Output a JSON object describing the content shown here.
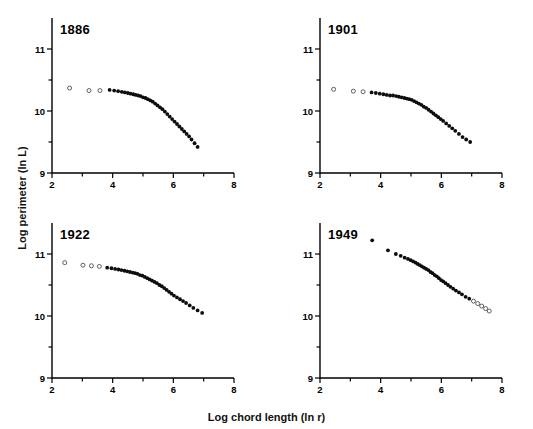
{
  "figure": {
    "xlabel": "Log chord length (ln r)",
    "ylabel": "Log perimeter (ln L)"
  },
  "chart_data": [
    {
      "type": "scatter",
      "title": "1886",
      "xlabel": "Log chord length (ln r)",
      "ylabel": "Log perimeter (ln L)",
      "xlim": [
        2,
        8
      ],
      "ylim": [
        9,
        11.5
      ],
      "xticks": [
        2,
        3,
        4,
        5,
        6,
        7,
        8
      ],
      "xticklabels": [
        "2",
        "",
        "4",
        "",
        "6",
        "",
        "8"
      ],
      "yticks": [
        9,
        9.5,
        10,
        10.5,
        11
      ],
      "yticklabels": [
        "9",
        "",
        "10",
        "",
        "11"
      ],
      "grid": false,
      "legend": null,
      "series": [
        {
          "name": "excluded (open circles)",
          "marker": "open",
          "points": [
            [
              2.58,
              10.37
            ],
            [
              3.22,
              10.33
            ],
            [
              3.58,
              10.33
            ]
          ]
        },
        {
          "name": "included (filled circles)",
          "marker": "filled",
          "points": [
            [
              3.9,
              10.34
            ],
            [
              4.05,
              10.33
            ],
            [
              4.18,
              10.32
            ],
            [
              4.3,
              10.31
            ],
            [
              4.4,
              10.3
            ],
            [
              4.5,
              10.29
            ],
            [
              4.59,
              10.28
            ],
            [
              4.68,
              10.27
            ],
            [
              4.76,
              10.26
            ],
            [
              4.84,
              10.25
            ],
            [
              4.92,
              10.24
            ],
            [
              5.0,
              10.22
            ],
            [
              5.08,
              10.21
            ],
            [
              5.16,
              10.19
            ],
            [
              5.24,
              10.17
            ],
            [
              5.32,
              10.15
            ],
            [
              5.4,
              10.12
            ],
            [
              5.48,
              10.09
            ],
            [
              5.56,
              10.06
            ],
            [
              5.64,
              10.03
            ],
            [
              5.72,
              9.99
            ],
            [
              5.8,
              9.95
            ],
            [
              5.88,
              9.91
            ],
            [
              5.96,
              9.87
            ],
            [
              6.04,
              9.83
            ],
            [
              6.12,
              9.79
            ],
            [
              6.2,
              9.75
            ],
            [
              6.28,
              9.71
            ],
            [
              6.36,
              9.67
            ],
            [
              6.44,
              9.63
            ],
            [
              6.52,
              9.59
            ],
            [
              6.6,
              9.54
            ],
            [
              6.7,
              9.48
            ],
            [
              6.8,
              9.42
            ]
          ]
        }
      ]
    },
    {
      "type": "scatter",
      "title": "1901",
      "xlabel": "Log chord length (ln r)",
      "ylabel": "Log perimeter (ln L)",
      "xlim": [
        2,
        8
      ],
      "ylim": [
        9,
        11.5
      ],
      "xticks": [
        2,
        3,
        4,
        5,
        6,
        7,
        8
      ],
      "xticklabels": [
        "2",
        "",
        "4",
        "",
        "6",
        "",
        "8"
      ],
      "yticks": [
        9,
        9.5,
        10,
        10.5,
        11
      ],
      "yticklabels": [
        "9",
        "",
        "10",
        "",
        "11"
      ],
      "grid": false,
      "legend": null,
      "series": [
        {
          "name": "excluded (open circles)",
          "marker": "open",
          "points": [
            [
              2.45,
              10.35
            ],
            [
              3.1,
              10.32
            ],
            [
              3.42,
              10.31
            ]
          ]
        },
        {
          "name": "included (filled circles)",
          "marker": "filled",
          "points": [
            [
              3.7,
              10.3
            ],
            [
              3.84,
              10.29
            ],
            [
              3.97,
              10.28
            ],
            [
              4.09,
              10.27
            ],
            [
              4.2,
              10.26
            ],
            [
              4.31,
              10.25
            ],
            [
              4.41,
              10.25
            ],
            [
              4.51,
              10.24
            ],
            [
              4.6,
              10.23
            ],
            [
              4.69,
              10.22
            ],
            [
              4.78,
              10.21
            ],
            [
              4.86,
              10.2
            ],
            [
              4.94,
              10.19
            ],
            [
              5.02,
              10.18
            ],
            [
              5.1,
              10.16
            ],
            [
              5.18,
              10.14
            ],
            [
              5.26,
              10.12
            ],
            [
              5.34,
              10.1
            ],
            [
              5.42,
              10.07
            ],
            [
              5.5,
              10.05
            ],
            [
              5.58,
              10.02
            ],
            [
              5.66,
              9.99
            ],
            [
              5.74,
              9.96
            ],
            [
              5.82,
              9.93
            ],
            [
              5.9,
              9.9
            ],
            [
              5.98,
              9.87
            ],
            [
              6.06,
              9.84
            ],
            [
              6.16,
              9.8
            ],
            [
              6.26,
              9.76
            ],
            [
              6.36,
              9.72
            ],
            [
              6.46,
              9.68
            ],
            [
              6.58,
              9.63
            ],
            [
              6.7,
              9.58
            ],
            [
              6.82,
              9.54
            ],
            [
              6.95,
              9.5
            ]
          ]
        }
      ]
    },
    {
      "type": "scatter",
      "title": "1922",
      "xlabel": "Log chord length (ln r)",
      "ylabel": "Log perimeter (ln L)",
      "xlim": [
        2,
        8
      ],
      "ylim": [
        9,
        11.5
      ],
      "xticks": [
        2,
        3,
        4,
        5,
        6,
        7,
        8
      ],
      "xticklabels": [
        "2",
        "",
        "4",
        "",
        "6",
        "",
        "8"
      ],
      "yticks": [
        9,
        9.5,
        10,
        10.5,
        11
      ],
      "yticklabels": [
        "9",
        "",
        "10",
        "",
        "11"
      ],
      "grid": false,
      "legend": null,
      "series": [
        {
          "name": "excluded (open circles)",
          "marker": "open",
          "points": [
            [
              2.42,
              10.86
            ],
            [
              3.02,
              10.82
            ],
            [
              3.3,
              10.81
            ],
            [
              3.56,
              10.8
            ]
          ]
        },
        {
          "name": "included (filled circles)",
          "marker": "filled",
          "points": [
            [
              3.82,
              10.78
            ],
            [
              3.96,
              10.77
            ],
            [
              4.08,
              10.76
            ],
            [
              4.19,
              10.75
            ],
            [
              4.29,
              10.74
            ],
            [
              4.39,
              10.73
            ],
            [
              4.48,
              10.72
            ],
            [
              4.57,
              10.71
            ],
            [
              4.66,
              10.7
            ],
            [
              4.74,
              10.69
            ],
            [
              4.82,
              10.68
            ],
            [
              4.9,
              10.66
            ],
            [
              4.98,
              10.65
            ],
            [
              5.06,
              10.63
            ],
            [
              5.14,
              10.61
            ],
            [
              5.22,
              10.59
            ],
            [
              5.3,
              10.57
            ],
            [
              5.38,
              10.55
            ],
            [
              5.46,
              10.53
            ],
            [
              5.54,
              10.5
            ],
            [
              5.62,
              10.48
            ],
            [
              5.7,
              10.45
            ],
            [
              5.78,
              10.42
            ],
            [
              5.86,
              10.39
            ],
            [
              5.94,
              10.36
            ],
            [
              6.02,
              10.33
            ],
            [
              6.12,
              10.3
            ],
            [
              6.22,
              10.27
            ],
            [
              6.32,
              10.24
            ],
            [
              6.42,
              10.21
            ],
            [
              6.54,
              10.17
            ],
            [
              6.66,
              10.13
            ],
            [
              6.8,
              10.09
            ],
            [
              6.95,
              10.05
            ]
          ]
        }
      ]
    },
    {
      "type": "scatter",
      "title": "1949",
      "xlabel": "Log chord length (ln r)",
      "ylabel": "Log perimeter (ln L)",
      "xlim": [
        2,
        8
      ],
      "ylim": [
        9,
        11.5
      ],
      "xticks": [
        2,
        3,
        4,
        5,
        6,
        7,
        8
      ],
      "xticklabels": [
        "2",
        "",
        "4",
        "",
        "6",
        "",
        "8"
      ],
      "yticks": [
        9,
        9.5,
        10,
        10.5,
        11
      ],
      "yticklabels": [
        "9",
        "",
        "10",
        "",
        "11"
      ],
      "grid": false,
      "legend": null,
      "series": [
        {
          "name": "included (filled circles)",
          "marker": "filled",
          "points": [
            [
              3.72,
              11.22
            ],
            [
              4.24,
              11.06
            ],
            [
              4.5,
              11.0
            ],
            [
              4.66,
              10.97
            ],
            [
              4.79,
              10.94
            ],
            [
              4.9,
              10.92
            ],
            [
              4.99,
              10.9
            ],
            [
              5.07,
              10.88
            ],
            [
              5.15,
              10.86
            ],
            [
              5.22,
              10.84
            ],
            [
              5.29,
              10.82
            ],
            [
              5.36,
              10.8
            ],
            [
              5.43,
              10.78
            ],
            [
              5.5,
              10.76
            ],
            [
              5.57,
              10.74
            ],
            [
              5.64,
              10.71
            ],
            [
              5.71,
              10.69
            ],
            [
              5.78,
              10.66
            ],
            [
              5.85,
              10.64
            ],
            [
              5.92,
              10.61
            ],
            [
              5.99,
              10.58
            ],
            [
              6.06,
              10.56
            ],
            [
              6.14,
              10.53
            ],
            [
              6.22,
              10.5
            ],
            [
              6.3,
              10.47
            ],
            [
              6.39,
              10.44
            ],
            [
              6.48,
              10.41
            ],
            [
              6.58,
              10.38
            ],
            [
              6.68,
              10.35
            ],
            [
              6.8,
              10.31
            ],
            [
              6.92,
              10.28
            ]
          ]
        },
        {
          "name": "excluded (open circles)",
          "marker": "open",
          "points": [
            [
              7.06,
              10.24
            ],
            [
              7.2,
              10.2
            ],
            [
              7.33,
              10.16
            ],
            [
              7.46,
              10.12
            ],
            [
              7.58,
              10.08
            ]
          ]
        }
      ]
    }
  ]
}
